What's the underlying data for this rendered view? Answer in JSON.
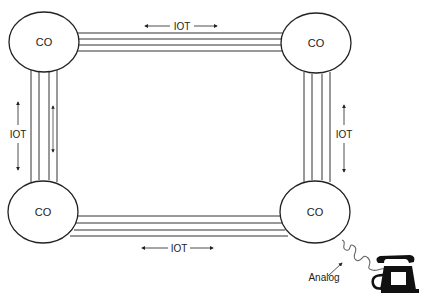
{
  "diagram": {
    "nodes": [
      {
        "id": "co-top-left",
        "label": "CO"
      },
      {
        "id": "co-top-right",
        "label": "CO"
      },
      {
        "id": "co-bottom-left",
        "label": "CO"
      },
      {
        "id": "co-bottom-right",
        "label": "CO"
      }
    ],
    "links": [
      {
        "id": "top",
        "label": "IOT",
        "from": "co-top-left",
        "to": "co-top-right"
      },
      {
        "id": "left",
        "label": "IOT",
        "from": "co-top-left",
        "to": "co-bottom-left"
      },
      {
        "id": "right",
        "label": "IOT",
        "from": "co-top-right",
        "to": "co-bottom-right"
      },
      {
        "id": "bottom",
        "label": "IOT",
        "from": "co-bottom-left",
        "to": "co-bottom-right"
      }
    ],
    "terminal": {
      "label": "Analog",
      "icon": "telephone-icon",
      "connects_to": "co-bottom-right"
    }
  }
}
